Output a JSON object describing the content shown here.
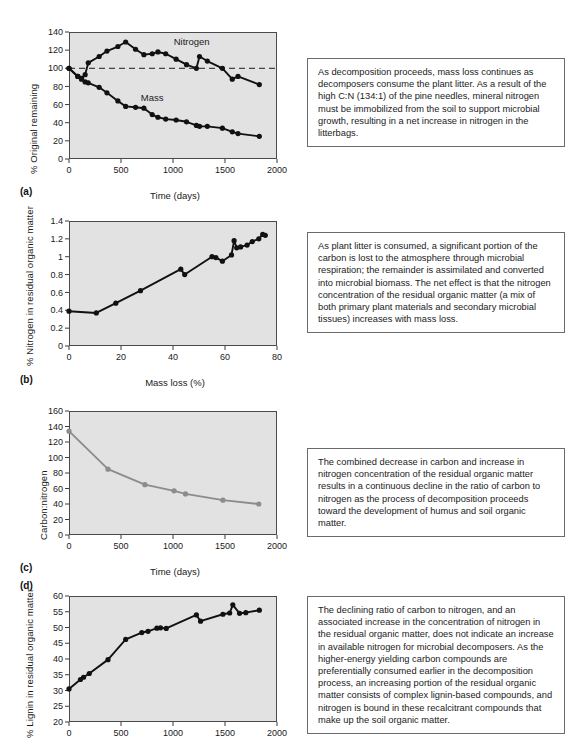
{
  "figure": {
    "panels": [
      {
        "letter": "(a)",
        "ylabel": "% Original remaining",
        "xlabel": "Time (days)",
        "text": "As decomposition proceeds, mass loss continues as decomposers consume the plant litter. As a result of the high C:N (134:1) of the pine needles, mineral nitrogen must be immobilized from the soil to support microbial growth, resulting in a net increase in nitrogen in the litterbags."
      },
      {
        "letter": "(b)",
        "ylabel": "% Nitrogen in residual organic matter",
        "xlabel": "Mass loss (%)",
        "text": "As plant litter is consumed, a significant portion of the carbon is lost to the atmosphere through microbial respiration; the remainder is assimilated and converted into microbial biomass. The net effect is that the nitrogen concentration of the residual organic matter (a mix of both primary plant materials and secondary microbial tissues) increases with mass loss."
      },
      {
        "letter": "(c)",
        "ylabel": "Carbon:nitrogen",
        "xlabel": "Time (days)",
        "text": "The combined decrease in carbon and increase in nitrogen concentration of the residual organic matter results in a continuous decline in the ratio of carbon to nitrogen as the process of decomposition proceeds toward the development of humus and soil organic matter."
      },
      {
        "letter": "(d)",
        "ylabel": "% Lignin in residual organic matter",
        "xlabel": "",
        "text": "The declining ratio of carbon to nitrogen, and an associated increase in the concentration of nitrogen in the residual organic matter, does not indicate an increase in available nitrogen for microbial decomposers. As the higher-energy yielding carbon compounds are preferentially consumed earlier in the decomposition process, an increasing portion of the residual organic matter consists of complex lignin-based compounds, and nitrogen is bound in these recalcitrant compounds that make up the soil organic matter."
      }
    ]
  },
  "chart_data": [
    {
      "type": "line",
      "panel": "a",
      "title": "",
      "xlabel": "Time (days)",
      "ylabel": "% Original remaining",
      "xlim": [
        0,
        2000
      ],
      "ylim": [
        0,
        140
      ],
      "xticks": [
        0,
        500,
        1000,
        1500,
        2000
      ],
      "yticks": [
        0,
        20,
        40,
        60,
        80,
        100,
        120,
        140
      ],
      "grid": false,
      "legend": "inline-labels",
      "reference_line": {
        "y": 100,
        "style": "dashed"
      },
      "series": [
        {
          "name": "Nitrogen",
          "color": "#111111",
          "label_x": 1180,
          "label_y": 126,
          "points": [
            [
              0,
              100
            ],
            [
              85,
              91
            ],
            [
              120,
              89
            ],
            [
              155,
              93
            ],
            [
              185,
              106
            ],
            [
              290,
              113
            ],
            [
              365,
              119
            ],
            [
              470,
              124
            ],
            [
              545,
              129
            ],
            [
              640,
              121
            ],
            [
              720,
              115
            ],
            [
              800,
              116
            ],
            [
              855,
              118
            ],
            [
              930,
              116
            ],
            [
              1030,
              110
            ],
            [
              1130,
              104
            ],
            [
              1225,
              100
            ],
            [
              1255,
              113
            ],
            [
              1330,
              108
            ],
            [
              1475,
              100
            ],
            [
              1570,
              88
            ],
            [
              1625,
              91
            ],
            [
              1830,
              82
            ]
          ]
        },
        {
          "name": "Mass",
          "color": "#111111",
          "label_x": 800,
          "label_y": 64,
          "points": [
            [
              0,
              100
            ],
            [
              85,
              91
            ],
            [
              120,
              88
            ],
            [
              155,
              85
            ],
            [
              185,
              84
            ],
            [
              290,
              79
            ],
            [
              365,
              73
            ],
            [
              470,
              64
            ],
            [
              545,
              58
            ],
            [
              640,
              57
            ],
            [
              720,
              56
            ],
            [
              800,
              49
            ],
            [
              855,
              46
            ],
            [
              930,
              44
            ],
            [
              1030,
              43
            ],
            [
              1130,
              41
            ],
            [
              1225,
              37
            ],
            [
              1255,
              36
            ],
            [
              1330,
              36
            ],
            [
              1475,
              34
            ],
            [
              1570,
              30
            ],
            [
              1625,
              28
            ],
            [
              1830,
              25
            ]
          ]
        }
      ]
    },
    {
      "type": "line",
      "panel": "b",
      "title": "",
      "xlabel": "Mass loss (%)",
      "ylabel": "% Nitrogen in residual organic matter",
      "xlim": [
        0,
        80
      ],
      "ylim": [
        0,
        1.4
      ],
      "xticks": [
        0,
        20,
        40,
        60,
        80
      ],
      "yticks": [
        0,
        0.2,
        0.4,
        0.6,
        0.8,
        1.0,
        1.2,
        1.4
      ],
      "grid": false,
      "series": [
        {
          "name": "% Nitrogen",
          "color": "#111111",
          "points": [
            [
              0,
              0.39
            ],
            [
              10.5,
              0.37
            ],
            [
              18,
              0.48
            ],
            [
              27.5,
              0.62
            ],
            [
              43,
              0.86
            ],
            [
              44.5,
              0.8
            ],
            [
              55,
              1.0
            ],
            [
              56.5,
              0.99
            ],
            [
              59,
              0.95
            ],
            [
              62.5,
              1.02
            ],
            [
              63.5,
              1.18
            ],
            [
              64.5,
              1.1
            ],
            [
              66,
              1.11
            ],
            [
              68.5,
              1.13
            ],
            [
              70.5,
              1.17
            ],
            [
              73,
              1.2
            ],
            [
              74.5,
              1.25
            ],
            [
              75.5,
              1.24
            ]
          ]
        }
      ]
    },
    {
      "type": "line",
      "panel": "c",
      "title": "",
      "xlabel": "Time (days)",
      "ylabel": "Carbon:nitrogen",
      "xlim": [
        0,
        2000
      ],
      "ylim": [
        0,
        160
      ],
      "xticks": [
        0,
        500,
        1000,
        1500,
        2000
      ],
      "yticks": [
        0,
        20,
        40,
        60,
        80,
        100,
        120,
        140,
        160
      ],
      "grid": false,
      "series": [
        {
          "name": "Carbon:nitrogen",
          "color": "#8c8c8c",
          "points": [
            [
              0,
              134
            ],
            [
              375,
              85
            ],
            [
              730,
              65
            ],
            [
              1010,
              57
            ],
            [
              1120,
              53
            ],
            [
              1480,
              45
            ],
            [
              1825,
              40
            ]
          ]
        }
      ]
    },
    {
      "type": "line",
      "panel": "d",
      "title": "",
      "xlabel": "",
      "ylabel": "% Lignin in residual organic matter",
      "xlim": [
        0,
        2000
      ],
      "ylim": [
        20,
        60
      ],
      "xticks": [
        0,
        500,
        1000,
        1500,
        2000
      ],
      "yticks": [
        20,
        25,
        30,
        35,
        40,
        45,
        50,
        55,
        60
      ],
      "grid": false,
      "series": [
        {
          "name": "% Lignin",
          "color": "#111111",
          "points": [
            [
              0,
              30.5
            ],
            [
              110,
              33.5
            ],
            [
              140,
              34.2
            ],
            [
              195,
              35.4
            ],
            [
              375,
              39.8
            ],
            [
              545,
              46.2
            ],
            [
              700,
              48.4
            ],
            [
              760,
              48.8
            ],
            [
              845,
              49.8
            ],
            [
              880,
              49.9
            ],
            [
              935,
              49.7
            ],
            [
              1225,
              54.0
            ],
            [
              1265,
              52.0
            ],
            [
              1480,
              54.2
            ],
            [
              1545,
              54.6
            ],
            [
              1575,
              57.2
            ],
            [
              1640,
              54.5
            ],
            [
              1700,
              54.7
            ],
            [
              1830,
              55.5
            ]
          ]
        }
      ]
    }
  ]
}
